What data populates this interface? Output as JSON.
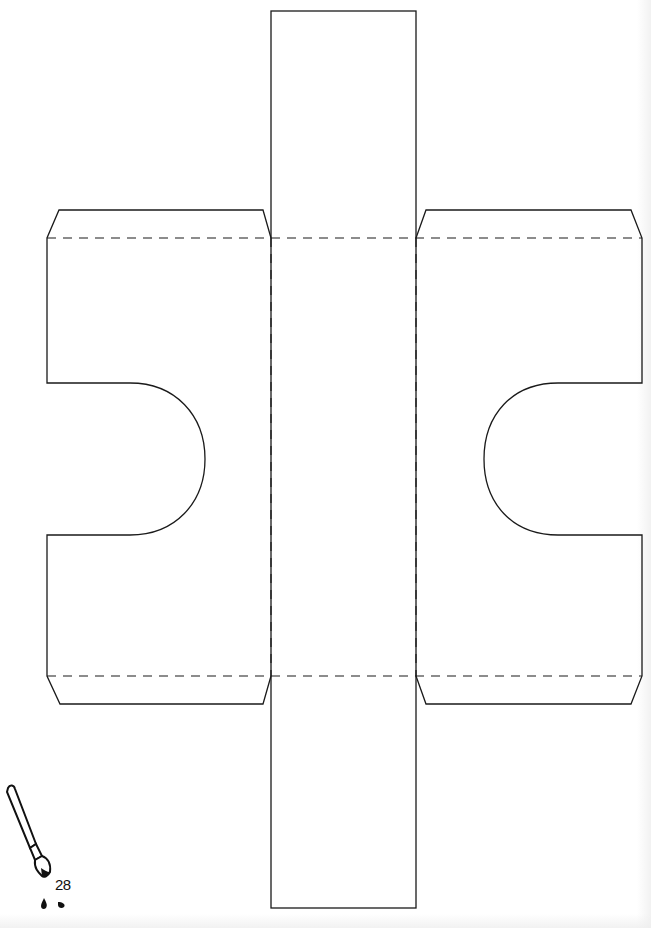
{
  "page": {
    "number": "28",
    "background": "#ffffff",
    "line_color": "#1a1a1a"
  },
  "template": {
    "description": "Puzzle-piece box net with central strip, two side wings with semicircular notches, tabs and dashed fold lines",
    "central_strip": {
      "x": 271,
      "y": 11,
      "width": 145,
      "height": 897
    },
    "fold_lines_horizontal_y": [
      238,
      676
    ],
    "fold_lines_vertical_x": [
      271,
      416
    ],
    "left_wing": {
      "x": 47,
      "width": 224,
      "notch": {
        "top": 383,
        "bottom": 535,
        "apex_x": 205
      }
    },
    "right_wing": {
      "x": 416,
      "width": 226,
      "notch": {
        "top": 383,
        "bottom": 535,
        "apex_x": 484
      }
    }
  },
  "icons": {
    "page_marker": "paintbrush-icon"
  }
}
